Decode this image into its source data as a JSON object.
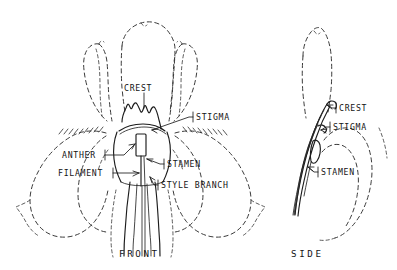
{
  "figure": {
    "ink_color": "#1c1c1c",
    "dashed_color": "#3a3a3a",
    "background_color": "#ffffff"
  },
  "views": {
    "front": {
      "caption": "FRONT",
      "labels": [
        {
          "id": "crest",
          "text": "CREST"
        },
        {
          "id": "stigma",
          "text": "STIGMA"
        },
        {
          "id": "anther",
          "text": "ANTHER"
        },
        {
          "id": "filament",
          "text": "FILAMENT"
        },
        {
          "id": "stamen",
          "text": "STAMEN"
        },
        {
          "id": "style_branch",
          "text": "STYLE BRANCH"
        }
      ]
    },
    "side": {
      "caption": "SIDE",
      "labels": [
        {
          "id": "crest",
          "text": "CREST"
        },
        {
          "id": "stigma",
          "text": "STIGMA"
        },
        {
          "id": "stamen",
          "text": "STAMEN"
        }
      ]
    }
  }
}
